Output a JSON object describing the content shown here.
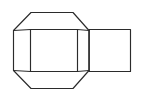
{
  "figure": {
    "caption": "",
    "kind": "technical-line-drawing",
    "background_color": "#ffffff",
    "stroke_color": "#2b2b2b",
    "stroke_width_px": 1.15,
    "canvas": {
      "width": 145,
      "height": 100
    },
    "parts": [
      {
        "name": "outer-hexagon",
        "label": "Outer hexagonal outline",
        "shape": "hexagon",
        "points": "13.5,30.5 31,12.5 73,12.5 89,30.5 89,70.5 73,88.5 31,88.5 13.5,70.5"
      },
      {
        "name": "inner-front-face",
        "label": "Inner rectangular front face",
        "shape": "rectangle",
        "points": "30.5,29.5 77.5,29.5 77.5,71.5 30.5,71.5"
      },
      {
        "name": "side-box",
        "label": "Attached rectangular box",
        "shape": "rectangle",
        "points": "89,29.5 130.5,29.5 130.5,71.5 89,71.5"
      },
      {
        "name": "connector-top-left",
        "label": "Top-left connecting edge",
        "shape": "line",
        "points": "13.5,30.5 30.5,29.5"
      },
      {
        "name": "connector-bottom-left",
        "label": "Bottom-left connecting edge",
        "shape": "line",
        "points": "13.5,70.5 30.5,71.5"
      },
      {
        "name": "connector-top-right",
        "label": "Top-right connecting edge",
        "shape": "line",
        "points": "77.5,29.5 89,30.5"
      },
      {
        "name": "connector-bottom-right",
        "label": "Bottom-right connecting edge",
        "shape": "line",
        "points": "77.5,71.5 89,70.5"
      }
    ]
  }
}
